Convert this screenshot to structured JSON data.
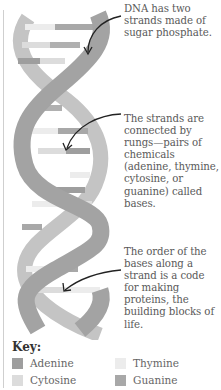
{
  "diagram": {
    "annotations": [
      {
        "id": "strands",
        "text": "DNA has two strands made of sugar phosphate."
      },
      {
        "id": "rungs",
        "text": "The strands are connected by rungs—pairs of chemicals (adenine, thymine, cytosine, or guanine) called bases."
      },
      {
        "id": "order",
        "text": "The order of the bases along a strand is a code for making proteins, the building blocks of life."
      }
    ],
    "colors": {
      "strand_front": "#a3a3a3",
      "strand_back": "#c2c2c2",
      "adenine": "#9e9e9e",
      "thymine": "#ececec",
      "cytosine": "#dcdcdc",
      "guanine": "#a8a8a8",
      "arrow": "#222222"
    }
  },
  "key": {
    "title": "Key:",
    "items": [
      {
        "label": "Adenine",
        "color": "#9e9e9e"
      },
      {
        "label": "Thymine",
        "color": "#ececec"
      },
      {
        "label": "Cytosine",
        "color": "#dcdcdc"
      },
      {
        "label": "Guanine",
        "color": "#a8a8a8"
      }
    ]
  }
}
